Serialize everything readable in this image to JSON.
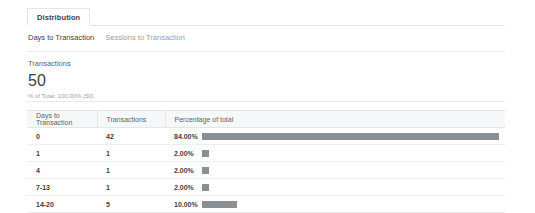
{
  "tabs": {
    "primary": [
      {
        "label": "Distribution",
        "active": true
      }
    ],
    "secondary": [
      {
        "label": "Days to Transaction",
        "active": true
      },
      {
        "label": "Sessions to Transaction",
        "active": false
      }
    ]
  },
  "metric": {
    "label": "Transactions",
    "value": "50",
    "sub": "% of Total: 100.00% (50)"
  },
  "table": {
    "headers": [
      "Days to Transaction",
      "Transactions",
      "Percentage of total"
    ],
    "rows": [
      {
        "bucket": "0",
        "transactions": "42",
        "percent_label": "84.00%",
        "percent": 84.0
      },
      {
        "bucket": "1",
        "transactions": "1",
        "percent_label": "2.00%",
        "percent": 2.0
      },
      {
        "bucket": "4",
        "transactions": "1",
        "percent_label": "2.00%",
        "percent": 2.0
      },
      {
        "bucket": "7-13",
        "transactions": "1",
        "percent_label": "2.00%",
        "percent": 2.0
      },
      {
        "bucket": "14-20",
        "transactions": "5",
        "percent_label": "10.00%",
        "percent": 10.0
      }
    ]
  },
  "chart_data": {
    "type": "bar",
    "categories": [
      "0",
      "1",
      "4",
      "7-13",
      "14-20"
    ],
    "series": [
      {
        "name": "Transactions",
        "values": [
          42,
          1,
          1,
          1,
          5
        ]
      },
      {
        "name": "Percentage of total",
        "values": [
          84.0,
          2.0,
          2.0,
          2.0,
          10.0
        ]
      }
    ],
    "xlabel": "Days to Transaction",
    "ylabel": "Percentage of total",
    "ylim": [
      0,
      100
    ],
    "grid": false,
    "legend": "none",
    "total_transactions": 50
  },
  "colors": {
    "bar": "#8a8f94",
    "header_bg": "#f6f7f8",
    "border": "#e4e6e8",
    "text_primary": "#3c4043",
    "text_secondary": "#5f6368",
    "text_muted": "#9aa0a6"
  }
}
